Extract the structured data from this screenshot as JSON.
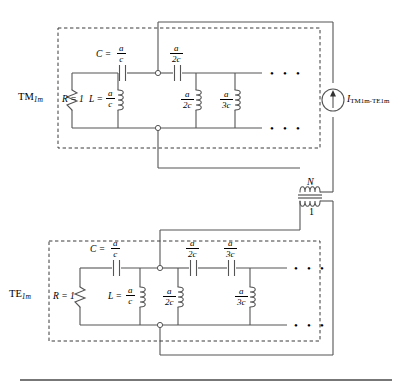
{
  "figure": {
    "type": "circuit-schematic",
    "separator_rule": true
  },
  "blocks": [
    {
      "id": "tm-block",
      "mode_label": "TM",
      "mode_subscript": "1m",
      "resistor": {
        "label": "R = 1",
        "symbol_name": "resistor"
      },
      "series_capacitors": [
        {
          "lead": "C =",
          "num": "a",
          "den": "c"
        },
        {
          "lead": "",
          "num": "a",
          "den": "2c"
        }
      ],
      "shunt_inductors": [
        {
          "lead": "L =",
          "num": "a",
          "den": "c"
        },
        {
          "lead": "",
          "num": "a",
          "den": "2c"
        },
        {
          "lead": "",
          "num": "a",
          "den": "3c"
        }
      ],
      "continuation": "• • •"
    },
    {
      "id": "te-block",
      "mode_label": "TE",
      "mode_subscript": "1m",
      "resistor": {
        "label": "R = 1",
        "symbol_name": "resistor"
      },
      "series_capacitors": [
        {
          "lead": "C =",
          "num": "a",
          "den": "c"
        },
        {
          "lead": "",
          "num": "a",
          "den": "2c"
        },
        {
          "lead": "",
          "num": "a",
          "den": "3c"
        }
      ],
      "shunt_inductors": [
        {
          "lead": "L =",
          "num": "a",
          "den": "c"
        },
        {
          "lead": "",
          "num": "a",
          "den": "2c"
        },
        {
          "lead": "",
          "num": "a",
          "den": "3c"
        }
      ],
      "continuation": "• • •"
    }
  ],
  "source": {
    "symbol_name": "current-source",
    "current_symbol": "I",
    "current_subscript": "TM1m-TE1m"
  },
  "transformer": {
    "symbol_name": "transformer",
    "primary_turns": "N",
    "secondary_turns": "1"
  },
  "colors": {
    "wire": "#555555",
    "text": "#000000",
    "dashed_box": "#3a3a3a",
    "background": "#ffffff"
  }
}
